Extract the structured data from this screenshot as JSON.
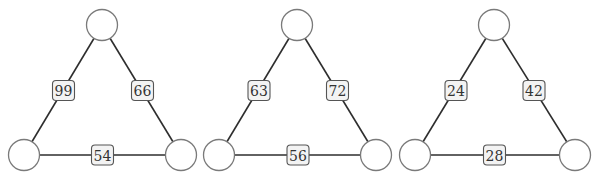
{
  "diagram": {
    "title": "",
    "puzzles": [
      {
        "nodes": {
          "top": {
            "value": ""
          },
          "bottom_left": {
            "value": ""
          },
          "bottom_right": {
            "value": ""
          }
        },
        "edges": {
          "left": {
            "label": "99"
          },
          "right": {
            "label": "66"
          },
          "bottom": {
            "label": "54"
          }
        }
      },
      {
        "nodes": {
          "top": {
            "value": ""
          },
          "bottom_left": {
            "value": ""
          },
          "bottom_right": {
            "value": ""
          }
        },
        "edges": {
          "left": {
            "label": "63"
          },
          "right": {
            "label": "72"
          },
          "bottom": {
            "label": "56"
          }
        }
      },
      {
        "nodes": {
          "top": {
            "value": ""
          },
          "bottom_left": {
            "value": ""
          },
          "bottom_right": {
            "value": ""
          }
        },
        "edges": {
          "left": {
            "label": "24"
          },
          "right": {
            "label": "42"
          },
          "bottom": {
            "label": "28"
          }
        }
      }
    ],
    "colors": {
      "edge": "#2e2e2e",
      "node_stroke": "#7a7a7a",
      "node_fill": "#ffffff",
      "label_fill": "#f3f3f3",
      "label_stroke": "#555555"
    }
  }
}
